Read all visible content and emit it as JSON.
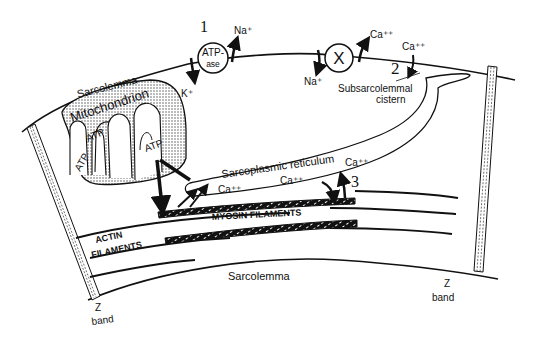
{
  "figure": {
    "page_number_partial": "...",
    "labels": {
      "sarcolemma_top": "Sarcolemma",
      "sarcolemma_bottom": "Sarcolemma",
      "mitochondrion": "Mitochondrion",
      "atp_1": "ATP",
      "atp_2": "ATP",
      "atp_3": "ATP",
      "atpase_line1": "ATP-",
      "atpase_line2": "ase",
      "exchanger": "X",
      "na_out": "Na⁺",
      "k_in": "K⁺",
      "na_in": "Na⁺",
      "ca_out_exchanger": "Ca⁺⁺",
      "ca_subsarcolemmal": "Ca⁺⁺",
      "subsarcolemmal_line1": "Subsarcolemmal",
      "subsarcolemmal_line2": "cistern",
      "sarcoplasmic_reticulum": "Sarcoplasmic  reticulum",
      "ca_sr_1": "Ca⁺⁺",
      "ca_sr_2": "Ca⁺⁺",
      "ca_sr_3": "Ca⁺⁺",
      "myosin": "MYOSIN  FILAMENTS",
      "actin_line1": "ACTIN",
      "actin_line2": "FILAMENTS",
      "z_left": "Z",
      "band_left": "band",
      "z_right": "Z",
      "band_right": "band"
    },
    "step_numbers": {
      "step1": "1",
      "step2": "2",
      "step3": "3"
    },
    "colors": {
      "ink": "#111111",
      "background": "#ffffff",
      "stipple": "#bdbdbd"
    }
  }
}
